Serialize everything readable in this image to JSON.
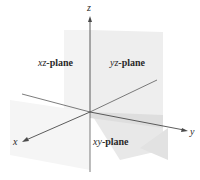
{
  "diagram": {
    "axes": {
      "x": {
        "label": "x"
      },
      "y": {
        "label": "y"
      },
      "z": {
        "label": "z"
      }
    },
    "planes": {
      "xz": {
        "var": "xz",
        "suffix": "-plane"
      },
      "yz": {
        "var": "yz",
        "suffix": "-plane"
      },
      "xy": {
        "var": "xy",
        "suffix": "-plane"
      }
    },
    "colors": {
      "axis": "#4a4a4a",
      "plane_fill_light": "#ececec",
      "plane_fill_mid": "#e2e2e2",
      "plane_fill_dark": "#d8d8d8",
      "text": "#2a2a2a"
    }
  }
}
